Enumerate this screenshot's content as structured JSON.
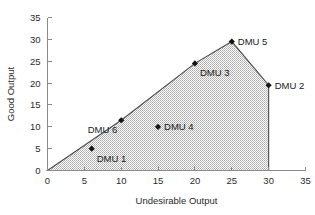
{
  "chart_data": {
    "type": "scatter",
    "title": "",
    "subtitle": "",
    "xlabel": "Undesirable Output",
    "ylabel": "Good Output",
    "xlim": [
      0,
      35
    ],
    "ylim": [
      0,
      35
    ],
    "xticks": [
      0,
      5,
      10,
      15,
      20,
      25,
      30,
      35
    ],
    "yticks": [
      0,
      5,
      10,
      15,
      20,
      25,
      30,
      35
    ],
    "xtick_labels": [
      "0",
      "5",
      "10",
      "15",
      "20",
      "25",
      "30",
      "35"
    ],
    "ytick_labels": [
      "0",
      "5",
      "10",
      "15",
      "20",
      "25",
      "30",
      "35"
    ],
    "grid": false,
    "legend": null,
    "legend_position": "none",
    "colors": {
      "region_fill": "#c9c9c9",
      "region_edge": "#4a4a4a",
      "marker": "#141414",
      "axis": "#8a8a8a",
      "text": "#2b2b2b",
      "background": "#ffffff"
    },
    "region": {
      "name": "production-possibility-set",
      "fill_style": "hatched-gray",
      "vertices": [
        [
          0,
          0
        ],
        [
          10,
          11.5
        ],
        [
          20,
          24.5
        ],
        [
          25,
          29.5
        ],
        [
          30,
          19.5
        ],
        [
          30,
          0
        ]
      ]
    },
    "points": [
      {
        "label": "DMU 1",
        "x": 6,
        "y": 5,
        "label_pos": "below-right",
        "on_frontier": false
      },
      {
        "label": "DMU 6",
        "x": 10,
        "y": 11.5,
        "label_pos": "below-left",
        "on_frontier": true
      },
      {
        "label": "DMU 4",
        "x": 15,
        "y": 10,
        "label_pos": "right",
        "on_frontier": false
      },
      {
        "label": "DMU 3",
        "x": 20,
        "y": 24.5,
        "label_pos": "below-right",
        "on_frontier": true
      },
      {
        "label": "DMU 5",
        "x": 25,
        "y": 29.5,
        "label_pos": "right",
        "on_frontier": true
      },
      {
        "label": "DMU 2",
        "x": 30,
        "y": 19.5,
        "label_pos": "right",
        "on_frontier": true
      }
    ]
  }
}
